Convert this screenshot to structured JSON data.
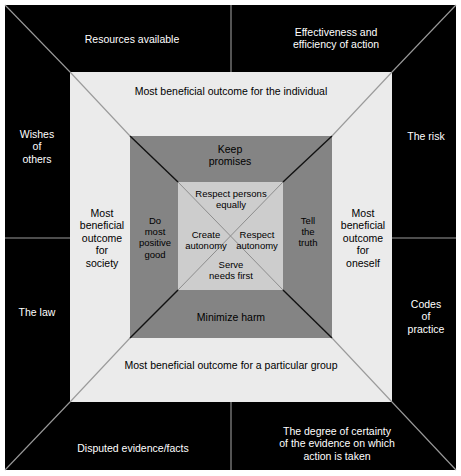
{
  "diagram": {
    "colors": {
      "outer_frame": "#000000",
      "layer_white": "#ebebeb",
      "layer_gray": "#848484",
      "layer_inner": "#cdcdcd",
      "text_on_dark": "#ffffff",
      "text_on_light": "#000000",
      "page_background": "#ffffff"
    },
    "outer_ring": {
      "name": "external-constraints-ring",
      "items": [
        {
          "id": "resources",
          "label": "Resources available",
          "position": "top-left"
        },
        {
          "id": "effectiveness",
          "label": "Effectiveness and\nefficiency of action",
          "position": "top-right"
        },
        {
          "id": "wishes",
          "label": "Wishes\nof\nothers",
          "position": "left-upper"
        },
        {
          "id": "risk",
          "label": "The risk",
          "position": "right-upper"
        },
        {
          "id": "law",
          "label": "The law",
          "position": "left-lower"
        },
        {
          "id": "codes",
          "label": "Codes\nof\npractice",
          "position": "right-lower"
        },
        {
          "id": "disputed",
          "label": "Disputed evidence/facts",
          "position": "bottom-left"
        },
        {
          "id": "degree",
          "label": "The degree of certainty\nof the evidence on which\naction is taken",
          "position": "bottom-right"
        }
      ]
    },
    "outcomes_ring": {
      "name": "beneficial-outcomes-ring",
      "items": [
        {
          "id": "individual",
          "label": "Most beneficial outcome for the individual",
          "position": "top"
        },
        {
          "id": "society",
          "label": "Most\nbeneficial\noutcome\nfor\nsociety",
          "position": "left"
        },
        {
          "id": "oneself",
          "label": "Most\nbeneficial\noutcome\nfor\noneself",
          "position": "right"
        },
        {
          "id": "group",
          "label": "Most beneficial outcome for a particular group",
          "position": "bottom"
        }
      ]
    },
    "duties_ring": {
      "name": "duties-ring",
      "items": [
        {
          "id": "keep-promises",
          "label": "Keep\npromises",
          "position": "top"
        },
        {
          "id": "do-most-good",
          "label": "Do\nmost\npositive\ngood",
          "position": "left"
        },
        {
          "id": "tell-truth",
          "label": "Tell\nthe\ntruth",
          "position": "right"
        },
        {
          "id": "minimize-harm",
          "label": "Minimize harm",
          "position": "bottom"
        }
      ]
    },
    "core_ring": {
      "name": "core-principles",
      "items": [
        {
          "id": "respect-persons-equally",
          "label": "Respect persons\nequally",
          "position": "top"
        },
        {
          "id": "create-autonomy",
          "label": "Create\nautonomy",
          "position": "left"
        },
        {
          "id": "respect-autonomy",
          "label": "Respect\nautonomy",
          "position": "right"
        },
        {
          "id": "serve-needs-first",
          "label": "Serve\nneeds first",
          "position": "bottom"
        }
      ]
    }
  }
}
